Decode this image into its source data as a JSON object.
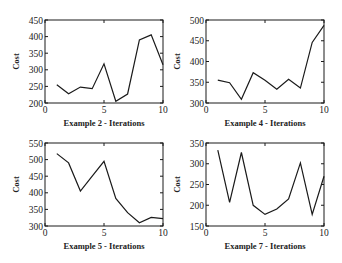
{
  "chart_data": [
    {
      "type": "line",
      "title": "",
      "xlabel": "Example 2 - Iterations",
      "ylabel": "Cost",
      "xlim": [
        0,
        10
      ],
      "ylim": [
        200,
        450
      ],
      "xticks": [
        0,
        5,
        10
      ],
      "yticks": [
        200,
        250,
        300,
        350,
        400,
        450
      ],
      "grid": false,
      "x": [
        1,
        2,
        3,
        4,
        5,
        6,
        7,
        8,
        9,
        10
      ],
      "series": [
        {
          "name": "Cost",
          "values": [
            255,
            228,
            248,
            243,
            318,
            205,
            227,
            390,
            405,
            315
          ]
        }
      ]
    },
    {
      "type": "line",
      "title": "",
      "xlabel": "Example 4 - Iterations",
      "ylabel": "Cost",
      "xlim": [
        0,
        10
      ],
      "ylim": [
        300,
        500
      ],
      "xticks": [
        0,
        5,
        10
      ],
      "yticks": [
        300,
        350,
        400,
        450,
        500
      ],
      "grid": false,
      "x": [
        1,
        2,
        3,
        4,
        5,
        6,
        7,
        8,
        9,
        10
      ],
      "series": [
        {
          "name": "Cost",
          "values": [
            355,
            349,
            309,
            373,
            355,
            333,
            357,
            336,
            446,
            487
          ]
        }
      ]
    },
    {
      "type": "line",
      "title": "",
      "xlabel": "Example 5 - Iterations",
      "ylabel": "Cost",
      "xlim": [
        0,
        10
      ],
      "ylim": [
        300,
        550
      ],
      "xticks": [
        0,
        5,
        10
      ],
      "yticks": [
        300,
        350,
        400,
        450,
        500,
        550
      ],
      "grid": false,
      "x": [
        1,
        2,
        3,
        4,
        5,
        6,
        7,
        8,
        9,
        10
      ],
      "series": [
        {
          "name": "Cost",
          "values": [
            518,
            490,
            405,
            450,
            495,
            383,
            340,
            310,
            326,
            322
          ]
        }
      ]
    },
    {
      "type": "line",
      "title": "",
      "xlabel": "Example 7 - Iterations",
      "ylabel": "Cost",
      "xlim": [
        0,
        10
      ],
      "ylim": [
        150,
        350
      ],
      "xticks": [
        0,
        5,
        10
      ],
      "yticks": [
        150,
        200,
        250,
        300,
        350
      ],
      "grid": false,
      "x": [
        1,
        2,
        3,
        4,
        5,
        6,
        7,
        8,
        9,
        10
      ],
      "series": [
        {
          "name": "Cost",
          "values": [
            333,
            207,
            327,
            200,
            178,
            191,
            215,
            302,
            178,
            270
          ]
        }
      ]
    }
  ],
  "layout": {
    "panels": [
      {
        "left": 45,
        "top": 20,
        "width": 118,
        "height": 83
      },
      {
        "left": 206,
        "top": 20,
        "width": 118,
        "height": 83
      },
      {
        "left": 45,
        "top": 143,
        "width": 118,
        "height": 83
      },
      {
        "left": 206,
        "top": 143,
        "width": 118,
        "height": 83
      }
    ],
    "line_color": "#1a1a1a"
  }
}
